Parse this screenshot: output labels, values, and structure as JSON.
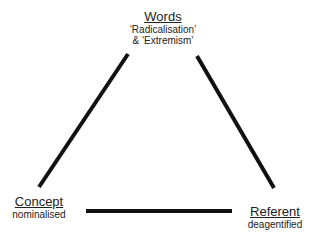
{
  "diagram": {
    "type": "semiotic-triangle",
    "nodes": {
      "words": {
        "title": "Words",
        "line1": "‘Radicalisation’",
        "line2": "& ‘Extremism’"
      },
      "concept": {
        "title": "Concept",
        "subtitle": "nominalised"
      },
      "referent": {
        "title": "Referent",
        "subtitle": "deagentified"
      }
    },
    "edges": [
      {
        "from": "words",
        "to": "concept",
        "style": "solid"
      },
      {
        "from": "words",
        "to": "referent",
        "style": "solid"
      },
      {
        "from": "concept",
        "to": "referent",
        "style": "solid"
      }
    ],
    "line_color": "#111111"
  }
}
